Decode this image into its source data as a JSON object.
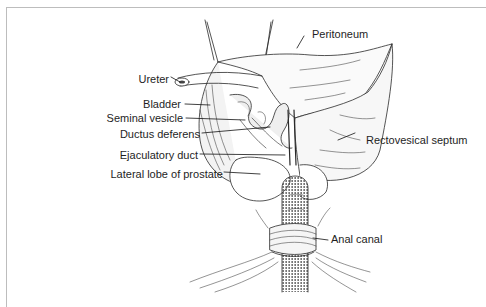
{
  "figure": {
    "type": "anatomical line illustration",
    "labels": {
      "peritoneum": "Peritoneum",
      "ureter": "Ureter",
      "bladder": "Bladder",
      "seminal_vesicle": "Seminal vesicle",
      "ductus_deferens": "Ductus deferens",
      "rectovesical_septum": "Rectovesical septum",
      "ejaculatory_duct": "Ejaculatory duct",
      "lateral_lobe_prostate": "Lateral lobe of prostate",
      "anal_canal": "Anal canal"
    },
    "colors": {
      "ink": "#1e1e1e",
      "frame": "#bdbdbd",
      "background": "#ffffff"
    }
  }
}
